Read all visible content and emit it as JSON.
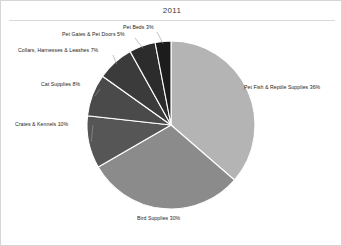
{
  "chart_data": {
    "type": "pie",
    "title": "2011",
    "xlabel": "",
    "ylabel": "",
    "legend_position": "none",
    "grid": false,
    "labels_show_percent": true,
    "categories": [
      "Pet Fish & Reptile Supplies",
      "Bird Supplies",
      "Crates & Kennels",
      "Cat Supplies",
      "Collars, Harnesses & Leashes",
      "Pet Gates & Pet Doors",
      "Pet Beds"
    ],
    "values": [
      36,
      30,
      10,
      8,
      7,
      5,
      3
    ],
    "slices": [
      {
        "label": "Pet Fish & Reptile Supplies",
        "value": 36,
        "display": "Pet Fish & Reptile Supplies 36%",
        "color": "#b4b4b4"
      },
      {
        "label": "Bird Supplies",
        "value": 30,
        "display": "Bird Supplies 30%",
        "color": "#8b8b8b"
      },
      {
        "label": "Crates & Kennels",
        "value": 10,
        "display": "Crates & Kennels 10%",
        "color": "#565656"
      },
      {
        "label": "Cat Supplies",
        "value": 8,
        "display": "Cat Supplies 8%",
        "color": "#4a4a4a"
      },
      {
        "label": "Collars, Harnesses & Leashes",
        "value": 7,
        "display": "Collars, Harnesses & Leashes 7%",
        "color": "#3b3b3b"
      },
      {
        "label": "Pet Gates & Pet Doors",
        "value": 5,
        "display": "Pet Gates & Pet Doors 5%",
        "color": "#2c2c2c"
      },
      {
        "label": "Pet Beds",
        "value": 3,
        "display": "Pet Beds 3%",
        "color": "#1c1c1c"
      }
    ]
  },
  "frame": {
    "border_color": "#d6d6d6",
    "title_rule_color": "#d9d9d9",
    "leader_line_color": "#9a9a9a",
    "slice_separator_color": "#ffffff"
  }
}
